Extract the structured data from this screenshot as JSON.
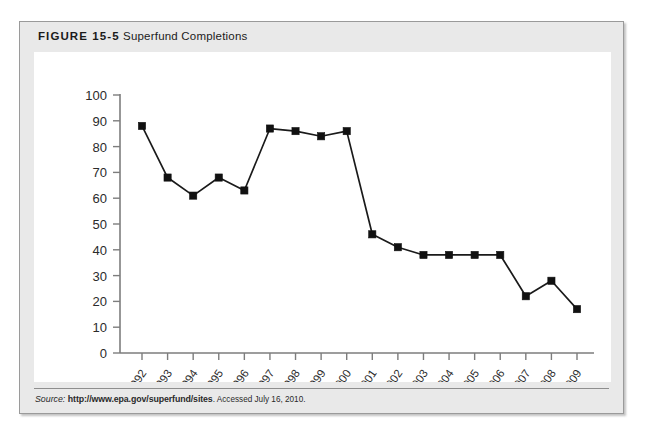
{
  "figure": {
    "number": "FIGURE 15-5",
    "title": "Superfund Completions"
  },
  "source": {
    "label": "Source:",
    "url": "http://www.epa.gov/superfund/sites",
    "accessed": ". Accessed July 16, 2010."
  },
  "colors": {
    "line": "#1a1a1a",
    "marker": "#111111",
    "axis": "#7d7d7d",
    "panel_bg": "#ffffff",
    "figure_bg": "#e9e9e9",
    "figure_border": "#9a9a9a",
    "text": "#2b2b2b"
  },
  "chart_data": {
    "type": "line",
    "title": "Superfund Completions",
    "xlabel": "",
    "ylabel": "",
    "ylim": [
      0,
      100
    ],
    "ytick_step": 10,
    "grid": false,
    "legend": "none",
    "markers": "square",
    "categories": [
      "1992",
      "1993",
      "1994",
      "1995",
      "1996",
      "1997",
      "1998",
      "1999",
      "2000",
      "2001",
      "2002",
      "2003",
      "2004",
      "2005",
      "2006",
      "2007",
      "2008",
      "2009"
    ],
    "values": [
      88,
      68,
      61,
      68,
      63,
      87,
      86,
      84,
      86,
      46,
      41,
      38,
      38,
      38,
      38,
      22,
      28,
      17
    ],
    "ytick_labels": [
      "100",
      "90",
      "80",
      "70",
      "60",
      "50",
      "40",
      "30",
      "20",
      "10",
      "0"
    ]
  }
}
